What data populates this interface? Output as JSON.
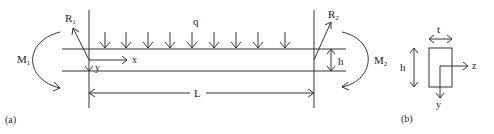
{
  "figure": {
    "panel_a": {
      "caption": "(a)",
      "labels": {
        "load": "q",
        "left_reaction": "R",
        "left_reaction_sub": "1",
        "right_reaction": "R",
        "right_reaction_sub": "2",
        "left_moment": "M",
        "left_moment_sub": "1",
        "right_moment": "M",
        "right_moment_sub": "2",
        "x_axis": "x",
        "y_axis": "y",
        "height": "h",
        "length": "L"
      },
      "load_arrow_count": 9
    },
    "panel_b": {
      "caption": "(b)",
      "labels": {
        "thickness": "t",
        "height": "h",
        "z_axis": "z",
        "y_axis": "y"
      }
    },
    "colors": {
      "line": "#333333",
      "text": "#222222",
      "background": "#ffffff"
    }
  }
}
